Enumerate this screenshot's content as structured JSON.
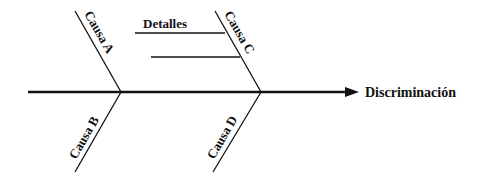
{
  "diagram": {
    "type": "fishbone",
    "effect": "Discriminación",
    "details_label": "Detalles",
    "causes": [
      {
        "id": "A",
        "label": "Causa A"
      },
      {
        "id": "B",
        "label": "Causa B"
      },
      {
        "id": "C",
        "label": "Causa C"
      },
      {
        "id": "D",
        "label": "Causa D"
      }
    ],
    "colors": {
      "line": "#111111",
      "background": "#ffffff"
    }
  }
}
